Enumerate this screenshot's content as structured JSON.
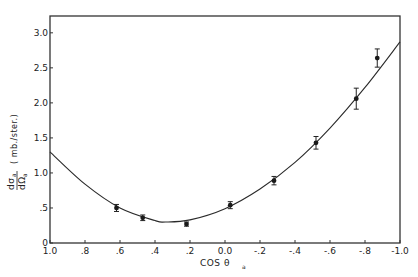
{
  "chart_data": {
    "type": "scatter",
    "title": "",
    "xlabel": "COS θ",
    "xlabel_sub": "a",
    "ylabel_num": "dσ",
    "ylabel_den": "dΩ",
    "ylabel_sub": "a",
    "ylabel_units": "( mb./ster.)",
    "xlim": [
      1.0,
      -1.0
    ],
    "ylim": [
      0,
      3.24
    ],
    "x_ticks": [
      1.0,
      0.8,
      0.6,
      0.4,
      0.2,
      0.0,
      -0.2,
      -0.4,
      -0.6,
      -0.8,
      -1.0
    ],
    "x_tick_labels": [
      "1.0",
      ".8",
      ".6",
      ".4",
      ".2",
      "0.0",
      "-.2",
      "-.4",
      "-.6",
      "-.8",
      "-1.0"
    ],
    "y_ticks": [
      0,
      0.5,
      1.0,
      1.5,
      2.0,
      2.5,
      3.0
    ],
    "y_tick_labels": [
      "0",
      ".5",
      "1.0",
      "1.5",
      "2.0",
      "2.5",
      "3.0"
    ],
    "grid": false,
    "series": [
      {
        "name": "measured",
        "type": "scatter",
        "x": [
          0.62,
          0.47,
          0.22,
          -0.03,
          -0.28,
          -0.52,
          -0.75,
          -0.87
        ],
        "y": [
          0.5,
          0.36,
          0.27,
          0.54,
          0.89,
          1.43,
          2.06,
          2.64
        ],
        "yerr": [
          0.05,
          0.04,
          0.03,
          0.05,
          0.06,
          0.09,
          0.15,
          0.13
        ]
      },
      {
        "name": "fit",
        "type": "line",
        "x": [
          1.0,
          0.8,
          0.6,
          0.4,
          0.34,
          0.2,
          0.0,
          -0.2,
          -0.4,
          -0.6,
          -0.8,
          -1.0
        ],
        "y": [
          1.3,
          0.84,
          0.5,
          0.32,
          0.3,
          0.33,
          0.49,
          0.77,
          1.15,
          1.64,
          2.22,
          2.87
        ]
      }
    ]
  }
}
